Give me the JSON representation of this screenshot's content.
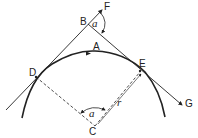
{
  "diagram": {
    "points": {
      "A": {
        "label": "A",
        "desc": "point on arc (direction of travel)"
      },
      "B": {
        "label": "B",
        "desc": "intersection of tangents"
      },
      "C": {
        "label": "C",
        "desc": "centre of circle"
      },
      "D": {
        "label": "D",
        "desc": "tangent point (start of curve)"
      },
      "E": {
        "label": "E",
        "desc": "tangent point (end of curve)"
      },
      "F": {
        "label": "F",
        "desc": "extension of first tangent"
      },
      "G": {
        "label": "G",
        "desc": "end of second tangent"
      }
    },
    "angles": {
      "at_B": {
        "label": "a",
        "desc": "deflection angle between BF and BG"
      },
      "at_C": {
        "label": "a",
        "desc": "central angle DCE"
      }
    },
    "radius": {
      "label": "r",
      "desc": "radius CE"
    },
    "colors": {
      "stroke": "#222222",
      "background": "#ffffff"
    }
  }
}
